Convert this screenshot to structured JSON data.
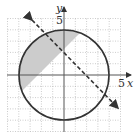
{
  "graph": {
    "x_axis_label": "x",
    "y_axis_label": "y",
    "x_tick_label": "5",
    "y_tick_label": "5",
    "grid": {
      "min": -5,
      "max": 5,
      "step": 1
    },
    "circle": {
      "equation": "x^2 + y^2 = 16",
      "center": [
        0,
        0
      ],
      "radius": 4,
      "style": "solid"
    },
    "line": {
      "equation": "y = -x + 2",
      "style": "dashed"
    },
    "shaded_region": "inside circle, above line",
    "colors": {
      "curve": "#333333",
      "grid": "#aaaaaa",
      "shade": "#cccccc",
      "axis": "#555555"
    }
  }
}
